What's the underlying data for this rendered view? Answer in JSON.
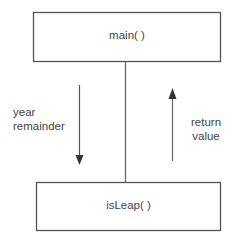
{
  "diagram": {
    "nodes": [
      {
        "id": "main",
        "label": "main( )"
      },
      {
        "id": "isLeap",
        "label": "isLeap( )"
      }
    ],
    "edges": [
      {
        "from": "main",
        "to": "isLeap",
        "direction": "down",
        "label_lines": [
          "year",
          "remainder"
        ]
      },
      {
        "from": "isLeap",
        "to": "main",
        "direction": "up",
        "label_lines": [
          "return",
          "value"
        ]
      }
    ],
    "colors": {
      "stroke": "#555555",
      "text": "#444444",
      "background": "#ffffff"
    }
  }
}
